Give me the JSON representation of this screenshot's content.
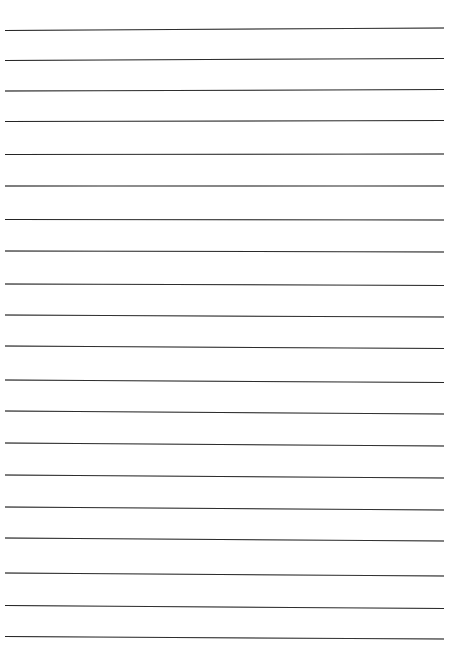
{
  "document": {
    "kind": "lined-paper-scan",
    "title": "Blank Ruled Paper",
    "page_width": 450,
    "page_height": 654,
    "background_color": "#ffffff",
    "written_content": "",
    "margin_rule": "none",
    "holes": "none"
  },
  "ruling": {
    "line_color": "#3b3b3b",
    "line_thickness_px": 1,
    "line_count": 21,
    "line_spacing_px": 30.6,
    "line_left_x": 5,
    "line_right_x": 444,
    "line_length_px": 439,
    "top_margin_px": 29,
    "bottom_margin_px": 18,
    "skew_note": "scan skew: lines tilt slightly up-right at top, slightly down-right at bottom",
    "lines": [
      {
        "index": 1,
        "left_y": 30.0,
        "right_y": 27.5,
        "angle_deg": -0.33
      },
      {
        "index": 2,
        "left_y": 60.0,
        "right_y": 58.0,
        "angle_deg": -0.26
      },
      {
        "index": 3,
        "left_y": 90.5,
        "right_y": 89.0,
        "angle_deg": -0.2
      },
      {
        "index": 4,
        "left_y": 121.0,
        "right_y": 120.0,
        "angle_deg": -0.13
      },
      {
        "index": 5,
        "left_y": 154.0,
        "right_y": 153.5,
        "angle_deg": -0.07
      },
      {
        "index": 6,
        "left_y": 185.5,
        "right_y": 185.5,
        "angle_deg": 0.0
      },
      {
        "index": 7,
        "left_y": 219.0,
        "right_y": 219.5,
        "angle_deg": 0.07
      },
      {
        "index": 8,
        "left_y": 250.5,
        "right_y": 251.5,
        "angle_deg": 0.13
      },
      {
        "index": 9,
        "left_y": 283.5,
        "right_y": 285.0,
        "angle_deg": 0.2
      },
      {
        "index": 10,
        "left_y": 314.5,
        "right_y": 316.5,
        "angle_deg": 0.26
      },
      {
        "index": 11,
        "left_y": 345.5,
        "right_y": 348.0,
        "angle_deg": 0.33
      },
      {
        "index": 12,
        "left_y": 379.5,
        "right_y": 382.0,
        "angle_deg": 0.33
      },
      {
        "index": 13,
        "left_y": 410.5,
        "right_y": 413.5,
        "angle_deg": 0.39
      },
      {
        "index": 14,
        "left_y": 442.5,
        "right_y": 445.5,
        "angle_deg": 0.39
      },
      {
        "index": 15,
        "left_y": 474.5,
        "right_y": 477.5,
        "angle_deg": 0.39
      },
      {
        "index": 16,
        "left_y": 506.5,
        "right_y": 509.5,
        "angle_deg": 0.39
      },
      {
        "index": 17,
        "left_y": 537.5,
        "right_y": 540.5,
        "angle_deg": 0.39
      },
      {
        "index": 18,
        "left_y": 572.5,
        "right_y": 575.5,
        "angle_deg": 0.39
      },
      {
        "index": 19,
        "left_y": 605.0,
        "right_y": 608.0,
        "angle_deg": 0.39
      },
      {
        "index": 20,
        "left_y": 636.0,
        "right_y": 638.5,
        "angle_deg": 0.33
      },
      {
        "index": 21,
        "left_y": 668.0,
        "right_y": 670.0,
        "angle_deg": 0.26
      }
    ]
  }
}
